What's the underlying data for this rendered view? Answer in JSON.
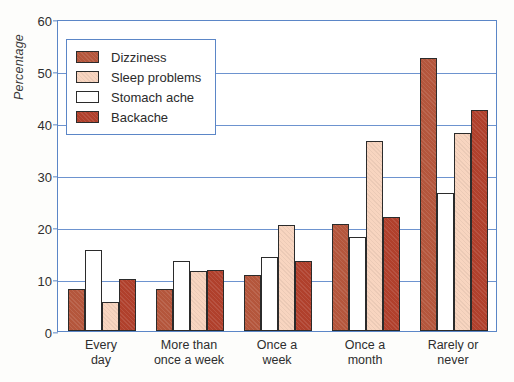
{
  "chart_data": {
    "type": "bar",
    "title": "",
    "xlabel": "",
    "ylabel": "Percentage",
    "ylim": [
      0,
      60
    ],
    "yticks": [
      0,
      10,
      20,
      30,
      40,
      50,
      60
    ],
    "grid": true,
    "legend_position": "top-left",
    "categories": [
      "Every day",
      "More than once a week",
      "Once a week",
      "Once a month",
      "Rarely or never"
    ],
    "category_lines": [
      [
        "Every",
        "day"
      ],
      [
        "More than",
        "once a week"
      ],
      [
        "Once a",
        "week"
      ],
      [
        "Once a",
        "month"
      ],
      [
        "Rarely or",
        "never"
      ]
    ],
    "series": [
      {
        "name": "Dizziness",
        "color": "#b4563c",
        "values": [
          8.0,
          8.0,
          10.8,
          20.5,
          52.5
        ]
      },
      {
        "name": "Sleep problems",
        "color": "#f8d5c0",
        "values": [
          5.5,
          11.5,
          20.3,
          36.5,
          38.0
        ]
      },
      {
        "name": "Stomach ache",
        "color": "#ffffff",
        "values": [
          15.5,
          13.5,
          14.2,
          18.0,
          26.5
        ]
      },
      {
        "name": "Backache",
        "color": "#b0402c",
        "values": [
          10.0,
          11.8,
          13.5,
          22.0,
          42.5
        ]
      }
    ],
    "series_order_in_group": [
      "Dizziness",
      "Stomach ache",
      "Sleep problems",
      "Backache"
    ],
    "axis_color": "#5b86c7",
    "grid_color": "#6d93cf",
    "bar_outline_color": "#2b2b2b"
  },
  "legend": {
    "items": [
      {
        "label": "Dizziness"
      },
      {
        "label": "Sleep problems"
      },
      {
        "label": "Stomach ache"
      },
      {
        "label": "Backache"
      }
    ]
  },
  "caption": {
    "partial_text": ""
  }
}
